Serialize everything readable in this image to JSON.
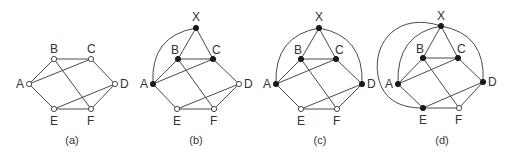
{
  "figure": {
    "panels": [
      {
        "caption": "(a)",
        "caption_pos": [
          72,
          144
        ],
        "nodes": {
          "A": {
            "x": 29,
            "y": 84,
            "filled": false,
            "label_dx": -13,
            "label_dy": 4
          },
          "B": {
            "x": 54,
            "y": 59,
            "filled": false,
            "label_dx": -4,
            "label_dy": -6
          },
          "C": {
            "x": 91,
            "y": 59,
            "filled": false,
            "label_dx": -4,
            "label_dy": -6
          },
          "D": {
            "x": 115,
            "y": 84,
            "filled": false,
            "label_dx": 5,
            "label_dy": 4
          },
          "E": {
            "x": 54,
            "y": 109,
            "filled": false,
            "label_dx": -4,
            "label_dy": 16
          },
          "F": {
            "x": 91,
            "y": 109,
            "filled": false,
            "label_dx": -4,
            "label_dy": 16
          }
        },
        "edges": [
          [
            "A",
            "B"
          ],
          [
            "B",
            "C"
          ],
          [
            "C",
            "D"
          ],
          [
            "D",
            "F"
          ],
          [
            "F",
            "E"
          ],
          [
            "E",
            "A"
          ],
          [
            "A",
            "C"
          ],
          [
            "B",
            "F"
          ],
          [
            "E",
            "D"
          ]
        ],
        "arcs": []
      },
      {
        "caption": "(b)",
        "caption_pos": [
          196,
          144
        ],
        "nodes": {
          "X": {
            "x": 196,
            "y": 28,
            "filled": true,
            "label_dx": -4,
            "label_dy": -7
          },
          "A": {
            "x": 153,
            "y": 84,
            "filled": true,
            "label_dx": -13,
            "label_dy": 4
          },
          "B": {
            "x": 178,
            "y": 59,
            "filled": true,
            "label_dx": -7,
            "label_dy": -5
          },
          "C": {
            "x": 213,
            "y": 59,
            "filled": true,
            "label_dx": -1,
            "label_dy": -5
          },
          "D": {
            "x": 239,
            "y": 84,
            "filled": false,
            "label_dx": 5,
            "label_dy": 4
          },
          "E": {
            "x": 177,
            "y": 109,
            "filled": false,
            "label_dx": -4,
            "label_dy": 16
          },
          "F": {
            "x": 214,
            "y": 109,
            "filled": false,
            "label_dx": -4,
            "label_dy": 16
          }
        },
        "edges": [
          [
            "A",
            "B"
          ],
          [
            "B",
            "C"
          ],
          [
            "C",
            "D"
          ],
          [
            "D",
            "F"
          ],
          [
            "F",
            "E"
          ],
          [
            "E",
            "A"
          ],
          [
            "A",
            "C"
          ],
          [
            "B",
            "F"
          ],
          [
            "E",
            "D"
          ],
          [
            "X",
            "B"
          ],
          [
            "X",
            "C"
          ]
        ],
        "arcs": [
          {
            "from": "A",
            "to": "X",
            "path": "M153,84 Q150,36 196,28"
          }
        ]
      },
      {
        "caption": "(c)",
        "caption_pos": [
          320,
          144
        ],
        "nodes": {
          "X": {
            "x": 319,
            "y": 28,
            "filled": true,
            "label_dx": -4,
            "label_dy": -7
          },
          "A": {
            "x": 276,
            "y": 84,
            "filled": true,
            "label_dx": -13,
            "label_dy": 4
          },
          "B": {
            "x": 301,
            "y": 59,
            "filled": true,
            "label_dx": -7,
            "label_dy": -5
          },
          "C": {
            "x": 336,
            "y": 59,
            "filled": true,
            "label_dx": -1,
            "label_dy": -5
          },
          "D": {
            "x": 362,
            "y": 84,
            "filled": true,
            "label_dx": 5,
            "label_dy": 4
          },
          "E": {
            "x": 301,
            "y": 109,
            "filled": false,
            "label_dx": -4,
            "label_dy": 16
          },
          "F": {
            "x": 337,
            "y": 109,
            "filled": false,
            "label_dx": -4,
            "label_dy": 16
          }
        },
        "edges": [
          [
            "A",
            "B"
          ],
          [
            "B",
            "C"
          ],
          [
            "C",
            "D"
          ],
          [
            "D",
            "F"
          ],
          [
            "F",
            "E"
          ],
          [
            "E",
            "A"
          ],
          [
            "A",
            "C"
          ],
          [
            "B",
            "F"
          ],
          [
            "E",
            "D"
          ],
          [
            "X",
            "B"
          ],
          [
            "X",
            "C"
          ]
        ],
        "arcs": [
          {
            "from": "A",
            "to": "X",
            "path": "M276,84 Q274,36 319,28"
          },
          {
            "from": "X",
            "to": "D",
            "path": "M319,28 Q364,36 362,84"
          }
        ]
      },
      {
        "caption": "(d)",
        "caption_pos": [
          442,
          144
        ],
        "nodes": {
          "X": {
            "x": 441,
            "y": 26,
            "filled": true,
            "label_dx": -4,
            "label_dy": -6
          },
          "A": {
            "x": 398,
            "y": 84,
            "filled": true,
            "label_dx": -13,
            "label_dy": 4
          },
          "B": {
            "x": 423,
            "y": 58,
            "filled": true,
            "label_dx": -7,
            "label_dy": -5
          },
          "C": {
            "x": 458,
            "y": 58,
            "filled": true,
            "label_dx": -1,
            "label_dy": -5
          },
          "D": {
            "x": 483,
            "y": 82,
            "filled": true,
            "label_dx": 5,
            "label_dy": 4
          },
          "E": {
            "x": 423,
            "y": 108,
            "filled": true,
            "label_dx": -4,
            "label_dy": 16
          },
          "F": {
            "x": 459,
            "y": 108,
            "filled": false,
            "label_dx": -4,
            "label_dy": 16
          }
        },
        "edges": [
          [
            "A",
            "B"
          ],
          [
            "B",
            "C"
          ],
          [
            "C",
            "D"
          ],
          [
            "D",
            "F"
          ],
          [
            "F",
            "E"
          ],
          [
            "E",
            "A"
          ],
          [
            "A",
            "C"
          ],
          [
            "B",
            "F"
          ],
          [
            "E",
            "D"
          ],
          [
            "X",
            "B"
          ],
          [
            "X",
            "C"
          ]
        ],
        "arcs": [
          {
            "from": "A",
            "to": "X",
            "path": "M398,84 Q396,34 441,26"
          },
          {
            "from": "X",
            "to": "D",
            "path": "M441,26 Q486,34 483,82"
          },
          {
            "from": "X",
            "to": "E",
            "path": "M441,26 C400,12 372,40 378,76 C383,100 400,108 423,108"
          }
        ]
      }
    ]
  }
}
